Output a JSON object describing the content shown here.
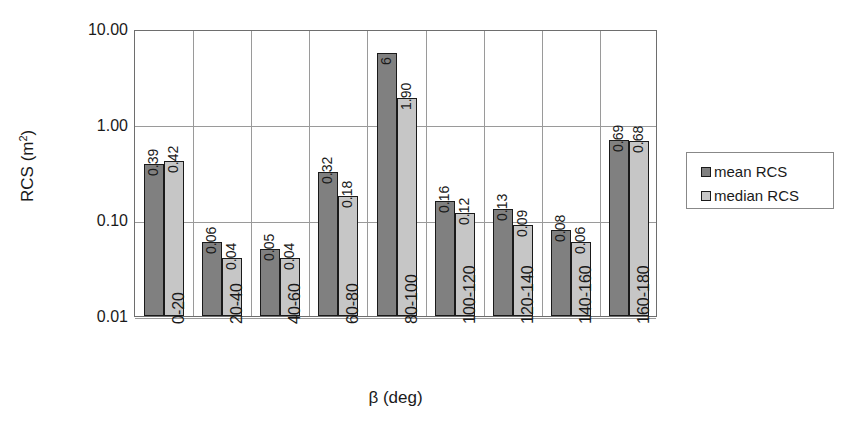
{
  "chart_data": {
    "type": "bar",
    "title": "",
    "xlabel": "β (deg)",
    "ylabel": "RCS (m²)",
    "ylabel_base": "RCS (m",
    "ylabel_sup": "2",
    "ylabel_tail": ")",
    "yscale": "log",
    "ylim": [
      0.01,
      10.0
    ],
    "grid": "horizontal-and-vertical",
    "legend_position": "right",
    "categories": [
      "0-20",
      "20-40",
      "40-60",
      "60-80",
      "80-100",
      "100-120",
      "120-140",
      "140-160",
      "160-180"
    ],
    "y_ticks": [
      "10.00",
      "1.00",
      "0.10",
      "0.01"
    ],
    "y_tick_values": [
      10.0,
      1.0,
      0.1,
      0.01
    ],
    "series": [
      {
        "name": "mean RCS",
        "color": "#808080",
        "values": [
          0.39,
          0.06,
          0.05,
          0.32,
          5.6,
          0.16,
          0.13,
          0.08,
          0.69
        ],
        "labels": [
          "0.39",
          "0.06",
          "0.05",
          "0.32",
          "6",
          "0.16",
          "0.13",
          "0.08",
          "0.69"
        ]
      },
      {
        "name": "median RCS",
        "color": "#c6c6c6",
        "values": [
          0.42,
          0.04,
          0.04,
          0.18,
          1.9,
          0.12,
          0.09,
          0.06,
          0.68
        ],
        "labels": [
          "0.42",
          "0.04",
          "0.04",
          "0.18",
          "1.90",
          "0.12",
          "0.09",
          "0.06",
          "0.68"
        ]
      }
    ]
  },
  "legend": {
    "items": [
      {
        "label": "mean RCS",
        "swatch": "mean"
      },
      {
        "label": "median RCS",
        "swatch": "median"
      }
    ]
  }
}
